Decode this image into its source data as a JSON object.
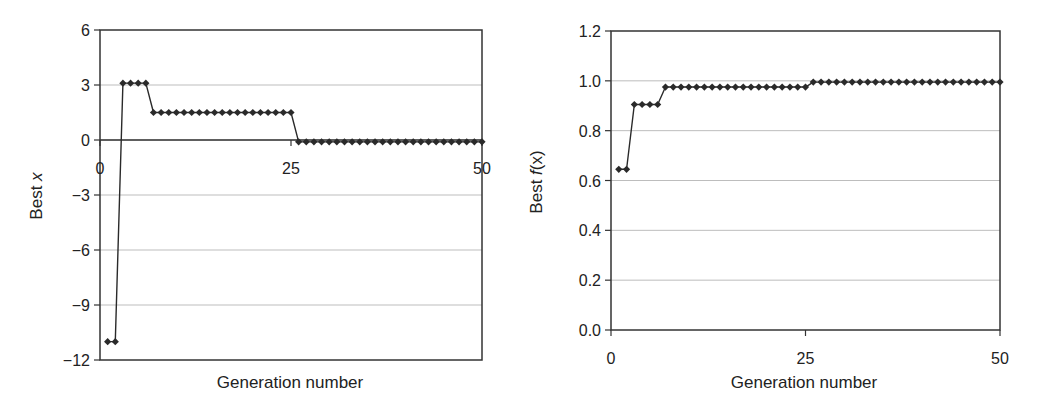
{
  "chart_data": [
    {
      "type": "line",
      "title": "",
      "xlabel": "Generation number",
      "ylabel": "Best x",
      "ylabel_italic_part": "x",
      "xlim": [
        0,
        50
      ],
      "ylim": [
        -12,
        6
      ],
      "xticks": [
        0,
        25,
        50
      ],
      "yticks": [
        6,
        3,
        0,
        -3,
        -6,
        -9,
        -12
      ],
      "ytick_labels": [
        "6",
        "3",
        "0",
        "−3",
        "−6",
        "−9",
        "−12"
      ],
      "grid": "horizontal",
      "x_axis_crosses_at": 0,
      "marker": "diamond",
      "series": [
        {
          "name": "Best x",
          "x": [
            1,
            2,
            3,
            4,
            5,
            6,
            7,
            8,
            9,
            10,
            11,
            12,
            13,
            14,
            15,
            16,
            17,
            18,
            19,
            20,
            21,
            22,
            23,
            24,
            25,
            26,
            27,
            28,
            29,
            30,
            31,
            32,
            33,
            34,
            35,
            36,
            37,
            38,
            39,
            40,
            41,
            42,
            43,
            44,
            45,
            46,
            47,
            48,
            49,
            50
          ],
          "values": [
            -11,
            -11,
            3.1,
            3.1,
            3.1,
            3.1,
            1.5,
            1.5,
            1.5,
            1.5,
            1.5,
            1.5,
            1.5,
            1.5,
            1.5,
            1.5,
            1.5,
            1.5,
            1.5,
            1.5,
            1.5,
            1.5,
            1.5,
            1.5,
            1.5,
            -0.1,
            -0.1,
            -0.1,
            -0.1,
            -0.1,
            -0.1,
            -0.1,
            -0.1,
            -0.1,
            -0.1,
            -0.1,
            -0.1,
            -0.1,
            -0.1,
            -0.1,
            -0.1,
            -0.1,
            -0.1,
            -0.1,
            -0.1,
            -0.1,
            -0.1,
            -0.1,
            -0.1,
            -0.1
          ]
        }
      ]
    },
    {
      "type": "line",
      "title": "",
      "xlabel": "Generation number",
      "ylabel": "Best f(x)",
      "xlim": [
        0,
        50
      ],
      "ylim": [
        0.0,
        1.2
      ],
      "xticks": [
        0,
        25,
        50
      ],
      "yticks": [
        1.2,
        1.0,
        0.8,
        0.6,
        0.4,
        0.2,
        0.0
      ],
      "ytick_labels": [
        "1.2",
        "1.0",
        "0.8",
        "0.6",
        "0.4",
        "0.2",
        "0.0"
      ],
      "grid": "horizontal",
      "marker": "diamond",
      "series": [
        {
          "name": "Best f(x)",
          "x": [
            1,
            2,
            3,
            4,
            5,
            6,
            7,
            8,
            9,
            10,
            11,
            12,
            13,
            14,
            15,
            16,
            17,
            18,
            19,
            20,
            21,
            22,
            23,
            24,
            25,
            26,
            27,
            28,
            29,
            30,
            31,
            32,
            33,
            34,
            35,
            36,
            37,
            38,
            39,
            40,
            41,
            42,
            43,
            44,
            45,
            46,
            47,
            48,
            49,
            50
          ],
          "values": [
            0.645,
            0.645,
            0.905,
            0.905,
            0.905,
            0.905,
            0.975,
            0.975,
            0.975,
            0.975,
            0.975,
            0.975,
            0.975,
            0.975,
            0.975,
            0.975,
            0.975,
            0.975,
            0.975,
            0.975,
            0.975,
            0.975,
            0.975,
            0.975,
            0.975,
            0.995,
            0.995,
            0.995,
            0.995,
            0.995,
            0.995,
            0.995,
            0.995,
            0.995,
            0.995,
            0.995,
            0.995,
            0.995,
            0.995,
            0.995,
            0.995,
            0.995,
            0.995,
            0.995,
            0.995,
            0.995,
            0.995,
            0.995,
            0.995,
            0.995
          ]
        }
      ]
    }
  ],
  "left": {
    "ylabel_prefix": "Best ",
    "ylabel_var": "x",
    "xlabel": "Generation number"
  },
  "right": {
    "ylabel_prefix": "Best ",
    "ylabel_f": "f",
    "ylabel_arg": "(x)",
    "xlabel": "Generation number"
  },
  "colors": {
    "line": "#2a2a2a",
    "grid": "#bdbdbd",
    "axis": "#333333"
  }
}
